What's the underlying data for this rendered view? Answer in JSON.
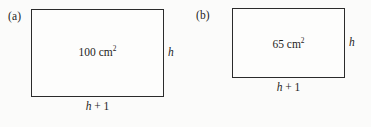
{
  "figure": {
    "panels": [
      {
        "key": "a",
        "label": "(a)",
        "area_value": "100",
        "area_unit": "cm",
        "area_exponent": "2",
        "height_label": "h",
        "base_var": "h",
        "base_rest": " + 1"
      },
      {
        "key": "b",
        "label": "(b)",
        "area_value": "65",
        "area_unit": "cm",
        "area_exponent": "2",
        "height_label": "h",
        "base_var": "h",
        "base_rest": " + 1"
      }
    ],
    "colors": {
      "background": "#fbfbfa",
      "stroke": "#2b2b2b",
      "text": "#1d1d1d",
      "fill": "#fdfdfc"
    }
  }
}
